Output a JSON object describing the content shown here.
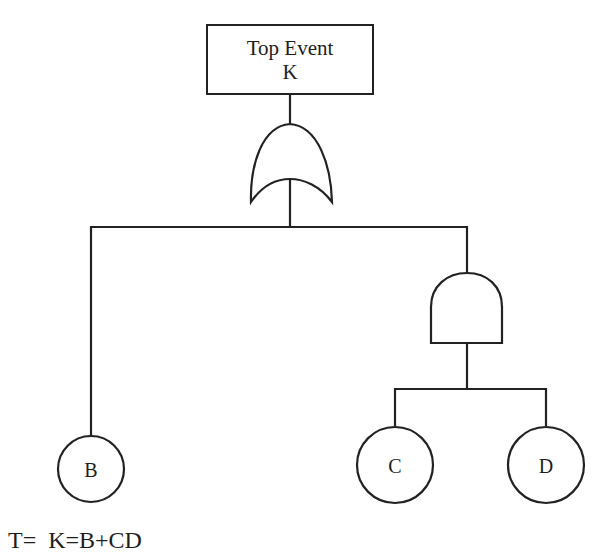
{
  "diagram": {
    "type": "fault-tree",
    "top_event": {
      "line1": "Top Event",
      "line2": "K"
    },
    "gates": [
      {
        "id": "or-gate",
        "type": "OR",
        "inputs": [
          "B",
          "and-gate"
        ],
        "output": "K"
      },
      {
        "id": "and-gate",
        "type": "AND",
        "inputs": [
          "C",
          "D"
        ],
        "output": "or-gate"
      }
    ],
    "basic_events": [
      {
        "id": "B",
        "label": "B"
      },
      {
        "id": "C",
        "label": "C"
      },
      {
        "id": "D",
        "label": "D"
      }
    ],
    "line_color": "#222222",
    "footer": "T=  K=B+CD"
  }
}
